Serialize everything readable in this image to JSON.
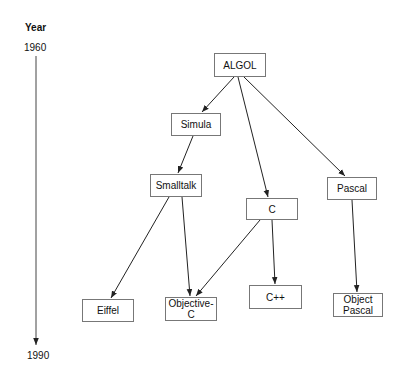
{
  "timeline": {
    "heading": "Year",
    "start_label": "1960",
    "end_label": "1990"
  },
  "nodes": [
    {
      "id": "algol",
      "label": "ALGOL",
      "x": 214,
      "y": 53,
      "w": 52,
      "h": 24
    },
    {
      "id": "simula",
      "label": "Simula",
      "x": 171,
      "y": 113,
      "w": 50,
      "h": 23
    },
    {
      "id": "smalltalk",
      "label": "Smalltalk",
      "x": 150,
      "y": 174,
      "w": 52,
      "h": 23
    },
    {
      "id": "c",
      "label": "C",
      "x": 246,
      "y": 198,
      "w": 52,
      "h": 22
    },
    {
      "id": "pascal",
      "label": "Pascal",
      "x": 327,
      "y": 177,
      "w": 50,
      "h": 23
    },
    {
      "id": "eiffel",
      "label": "Eiffel",
      "x": 82,
      "y": 299,
      "w": 52,
      "h": 23
    },
    {
      "id": "objective-c",
      "label": "Objective-C",
      "x": 165,
      "y": 297,
      "w": 52,
      "h": 24
    },
    {
      "id": "cpp",
      "label": "C++",
      "x": 249,
      "y": 285,
      "w": 53,
      "h": 24
    },
    {
      "id": "object-pascal",
      "label": "Object Pascal",
      "x": 333,
      "y": 293,
      "w": 50,
      "h": 24
    }
  ],
  "edges": [
    {
      "from": "ALGOL",
      "to": "Simula",
      "x1": 234,
      "y1": 77,
      "x2": 202,
      "y2": 112
    },
    {
      "from": "ALGOL",
      "to": "C",
      "x1": 238,
      "y1": 77,
      "x2": 268,
      "y2": 197
    },
    {
      "from": "ALGOL",
      "to": "Pascal",
      "x1": 244,
      "y1": 77,
      "x2": 345,
      "y2": 176
    },
    {
      "from": "Simula",
      "to": "Smalltalk",
      "x1": 193,
      "y1": 136,
      "x2": 178,
      "y2": 173
    },
    {
      "from": "Smalltalk",
      "to": "Eiffel",
      "x1": 169,
      "y1": 197,
      "x2": 111,
      "y2": 298
    },
    {
      "from": "Smalltalk",
      "to": "Objective-C",
      "x1": 182,
      "y1": 197,
      "x2": 190,
      "y2": 296
    },
    {
      "from": "C",
      "to": "Objective-C",
      "x1": 260,
      "y1": 220,
      "x2": 196,
      "y2": 296
    },
    {
      "from": "C",
      "to": "C++",
      "x1": 272,
      "y1": 220,
      "x2": 275,
      "y2": 284
    },
    {
      "from": "Pascal",
      "to": "Object Pascal",
      "x1": 352,
      "y1": 200,
      "x2": 357,
      "y2": 292
    }
  ]
}
